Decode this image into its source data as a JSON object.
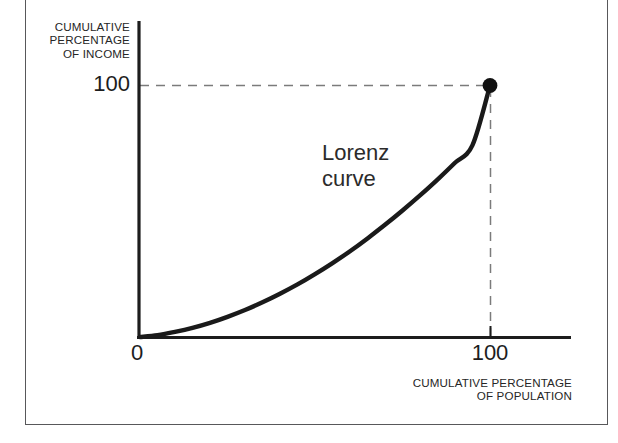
{
  "chart_data": {
    "type": "line",
    "title": "",
    "subtitle": "",
    "xlabel": "CUMULATIVE PERCENTAGE\nOF POPULATION",
    "ylabel": "CUMULATIVE\nPERCENTAGE\nOF INCOME",
    "xlim": [
      0,
      100
    ],
    "ylim": [
      0,
      100
    ],
    "grid": false,
    "legend_position": "none",
    "x_tick_labels": [
      "0",
      "100"
    ],
    "x_ticks": [
      0,
      100
    ],
    "y_tick_labels": [
      "100"
    ],
    "y_ticks": [
      100
    ],
    "annotations": [
      {
        "text": "Lorenz\ncurve",
        "x": 56,
        "y": 62
      }
    ],
    "series": [
      {
        "name": "Lorenz curve",
        "color": "#1a1a1a",
        "x": [
          0,
          5,
          10,
          15,
          20,
          25,
          30,
          35,
          40,
          45,
          50,
          55,
          60,
          65,
          70,
          75,
          80,
          85,
          90,
          95,
          100
        ],
        "values": [
          0,
          0.7,
          2.0,
          3.6,
          5.6,
          8.0,
          10.7,
          13.8,
          17.2,
          20.9,
          25.0,
          29.4,
          34.1,
          39.2,
          44.6,
          50.3,
          56.3,
          62.6,
          69.3,
          76.3,
          100
        ]
      }
    ],
    "markers": [
      {
        "label": "endpoint",
        "x": 100,
        "y": 100,
        "color": "#111111"
      }
    ],
    "guide_lines": [
      {
        "orientation": "horizontal",
        "value": 100,
        "style": "dashed",
        "color": "#7b7b7b"
      },
      {
        "orientation": "vertical",
        "value": 100,
        "style": "dashed",
        "color": "#7b7b7b"
      }
    ]
  },
  "axes": {
    "y_title": "CUMULATIVE\nPERCENTAGE\nOF INCOME",
    "x_title": "CUMULATIVE PERCENTAGE\nOF POPULATION",
    "y_tick_100": "100",
    "x_tick_0": "0",
    "x_tick_100": "100"
  },
  "annotation": {
    "curve_label": "Lorenz\ncurve"
  },
  "colors": {
    "curve": "#1a1a1a",
    "axis": "#1d1d1d",
    "guide": "#7b7b7b",
    "frame": "#58585a",
    "text": "#262626",
    "background": "#ffffff"
  }
}
